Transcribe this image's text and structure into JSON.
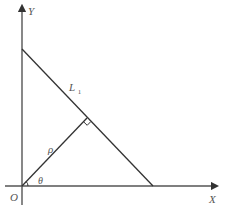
{
  "diagram": {
    "type": "geometry",
    "colors": {
      "line": "#333333",
      "axis": "#555555",
      "label": "#555555",
      "background": "#ffffff"
    },
    "labels": {
      "y_axis": "Y",
      "x_axis": "X",
      "origin": "O",
      "line_name": "L",
      "line_subscript": "1",
      "distance": "ρ",
      "angle": "θ"
    },
    "caption": ""
  }
}
